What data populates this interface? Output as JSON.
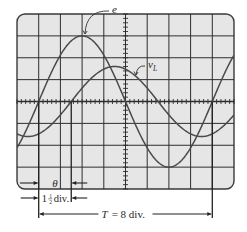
{
  "figure": {
    "type": "oscilloscope-display"
  },
  "screen": {
    "x": 17,
    "y": 14,
    "width": 217,
    "height": 175,
    "corner_radius": 8,
    "h_divisions": 10,
    "v_divisions": 8,
    "minor_ticks_per_div": 5,
    "fill": "#e6e6e6",
    "border": "#3a3a3a",
    "grid_color": "#2e2e2e"
  },
  "traces": [
    {
      "name": "e",
      "label": "e",
      "amplitude_div": 3,
      "period_div": 8,
      "zero_cross_rising_div": 1.0,
      "color": "#4a4a4a",
      "label_pos": {
        "x": 112,
        "y": 13
      },
      "leader_to": {
        "x": 85,
        "y": 34
      }
    },
    {
      "name": "v_L",
      "label": "v",
      "label_sub": "L",
      "amplitude_div": 1.6,
      "period_div": 8,
      "zero_cross_rising_div": 2.5,
      "color": "#4a4a4a",
      "label_pos": {
        "x": 148,
        "y": 68
      },
      "leader_to": {
        "x": 136,
        "y": 75
      }
    }
  ],
  "annotations": {
    "theta": {
      "label": "θ",
      "y": 183
    },
    "shift": {
      "label_int": "1",
      "label_frac_num": "1",
      "label_frac_den": "2",
      "label_unit": "div.",
      "y": 198,
      "value_div": 1.5
    },
    "period": {
      "label_T": "T",
      "label_rest": "= 8 div.",
      "y": 214,
      "value_div": 8
    }
  },
  "markers": {
    "e_zero_x_div": 1.0,
    "vl_zero_x_div": 2.5,
    "period_end_x_div": 9.0
  }
}
